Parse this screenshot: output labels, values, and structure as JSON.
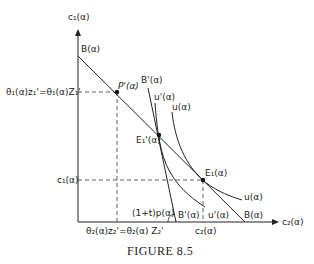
{
  "figure": {
    "caption": "FIGURE 8.5",
    "axes": {
      "y_label": "c₁(α)",
      "x_label": "c₂(α)"
    },
    "lines": {
      "budget": "B(α)",
      "budget_end": "B(α)",
      "budget_prime": "B'(α)",
      "budget_prime_end": "B'(α)",
      "indiff": "u(α)",
      "indiff_end": "u(α)",
      "indiff_prime": "u'(α)",
      "indiff_prime_end": "u'(α)"
    },
    "points": {
      "P_prime": "P'(α)",
      "E1_prime": "E₁'(α)",
      "E1": "E₁(α)"
    },
    "ticks": {
      "y_upper": "θ₁(α)z₁'=θ₁(α)Z₁'",
      "y_lower": "c₁(α)",
      "x_left": "θ₂(α)z₂'=θ₂(α) Z₂'",
      "x_right": "c₂(α)"
    },
    "angle_label": "(1+t)p(α)"
  }
}
